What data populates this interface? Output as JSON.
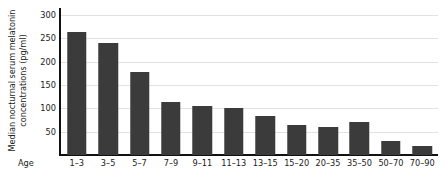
{
  "chart_data": {
    "type": "bar",
    "title": "",
    "subtitle": "",
    "xlabel": "Age",
    "ylabel": "Median nocturnal serum melatonin concentrations (pg/ml)",
    "ylabel_lines": [
      "Median nocturnal serum melatonin",
      "concentrations (pg/ml)"
    ],
    "categories": [
      "1–3",
      "3–5",
      "5–7",
      "7–9",
      "9–11",
      "11–13",
      "13–15",
      "15–20",
      "20–35",
      "35–50",
      "50–70",
      "70–90"
    ],
    "values": [
      264,
      240,
      177,
      113,
      104,
      101,
      84,
      65,
      60,
      70,
      31,
      20
    ],
    "yticks": [
      50,
      100,
      150,
      200,
      250,
      300
    ],
    "ytick_labels": [
      "50",
      "100",
      "150",
      "200",
      "250",
      "300"
    ],
    "ylim": [
      0,
      315
    ],
    "grid": true,
    "legend": false,
    "legend_position": "none",
    "bar_color": "#3b3b3b",
    "grid_color": "#e2e2e2",
    "axis_color": "#111111",
    "text_color": "#1a1a1a",
    "background_color": "#ffffff"
  }
}
